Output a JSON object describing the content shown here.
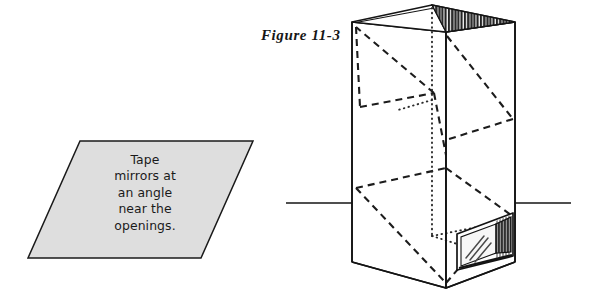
{
  "figure": {
    "label": "Figure 11-3"
  },
  "callout": {
    "shape": "parallelogram",
    "fill_color": "#dedede",
    "stroke_color": "#1a1a1a",
    "lines": [
      "Tape",
      "mirrors at",
      "an angle",
      "near the",
      "openings."
    ]
  },
  "diagram": {
    "type": "line-drawing",
    "colors": {
      "outline": "#141414",
      "hidden_edge": "#1c1c1c",
      "mirror_dark": "#2b2b2b",
      "mirror_light": "#f4f4f4",
      "ground_line": "#141414"
    },
    "parts": [
      {
        "name": "box-top-face",
        "style": "solid-outline"
      },
      {
        "name": "top-mirror",
        "style": "vertical-hatch-dark"
      },
      {
        "name": "box-left-face",
        "style": "solid-outline"
      },
      {
        "name": "box-right-face",
        "style": "solid-outline"
      },
      {
        "name": "hidden-edges",
        "style": "dashed"
      },
      {
        "name": "light-path",
        "style": "dotted"
      },
      {
        "name": "bottom-mirror",
        "style": "vertical-hatch-dark"
      },
      {
        "name": "ground-line",
        "style": "solid"
      }
    ]
  }
}
